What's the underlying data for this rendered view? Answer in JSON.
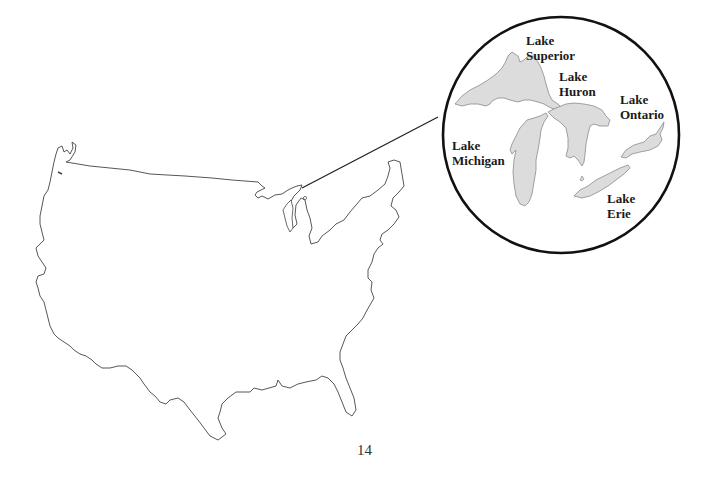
{
  "map": {
    "title": "",
    "subject": "Contiguous United States outline with Great Lakes inset",
    "colors": {
      "outline": "#444444",
      "lake_fill": "#dcdcdc",
      "lake_stroke": "#8a8a8a",
      "inset_circle": "#111111",
      "leader_line": "#222222"
    },
    "inset": {
      "lakes": [
        {
          "name": "superior",
          "line1": "Lake",
          "line2": "Superior"
        },
        {
          "name": "huron",
          "line1": "Lake",
          "line2": "Huron"
        },
        {
          "name": "ontario",
          "line1": "Lake",
          "line2": "Ontario"
        },
        {
          "name": "michigan",
          "line1": "Lake",
          "line2": "Michigan"
        },
        {
          "name": "erie",
          "line1": "Lake",
          "line2": "Erie"
        }
      ]
    }
  },
  "page": {
    "number": "14"
  }
}
